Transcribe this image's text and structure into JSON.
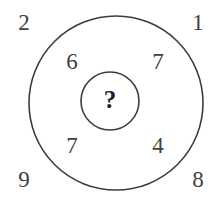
{
  "figure": {
    "background_color": "#ffffff",
    "stroke_color": "#3c3c3c",
    "digit_color": "#414141",
    "question_color": "#1e1e1e"
  },
  "shapes": {
    "outer_circle": {
      "name": "outer-circle",
      "center_x": 116,
      "center_y": 103,
      "radius": 87,
      "stroke_width": 1.6
    },
    "inner_circle": {
      "name": "inner-circle",
      "center_x": 110,
      "center_y": 101,
      "radius": 29,
      "stroke_width": 1.6
    }
  },
  "outer_numbers": {
    "top_left": "2",
    "top_right": "1",
    "bottom_left": "9",
    "bottom_right": "8"
  },
  "ring_numbers": {
    "top_left": "6",
    "top_right": "7",
    "bottom_left": "7",
    "bottom_right": "4"
  },
  "center": {
    "value": "?"
  }
}
